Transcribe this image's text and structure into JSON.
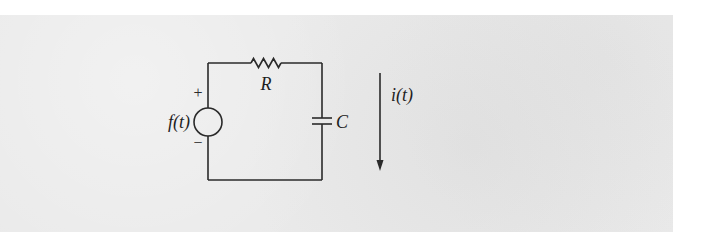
{
  "diagram": {
    "type": "circuit",
    "background_color": "#eaeaea",
    "line_color": "#2a2a2a",
    "source": {
      "label": "f(t)",
      "plus_sign": "+",
      "minus_sign": "−"
    },
    "resistor": {
      "label": "R"
    },
    "capacitor": {
      "label": "C"
    },
    "current": {
      "label": "i(t)",
      "direction": "down"
    }
  }
}
